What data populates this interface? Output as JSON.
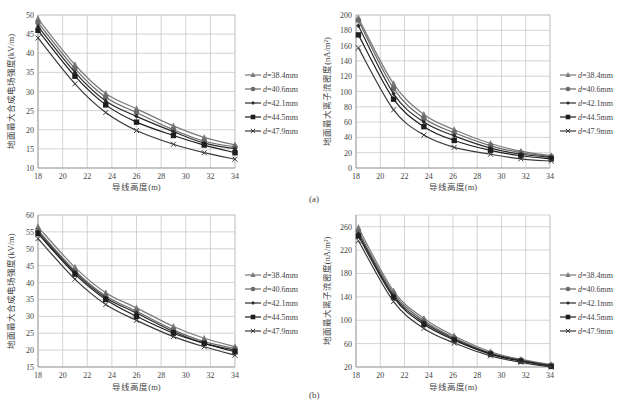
{
  "panels": {
    "a": "(a)",
    "b": "(b)"
  },
  "legend_labels": [
    "d=38.4mm",
    "d=40.6mm",
    "d=42.1mm",
    "d=44.5mm",
    "d=47.9mm"
  ],
  "chart_data": [
    {
      "id": "a-left",
      "type": "line",
      "title": "",
      "xlabel": "导线高度(m)",
      "ylabel": "地面最大合成电场强度(kV/m)",
      "xlim": [
        18,
        34
      ],
      "ylim": [
        10,
        50
      ],
      "xticks": [
        18,
        20,
        22,
        24,
        26,
        28,
        30,
        32,
        34
      ],
      "yticks": [
        10,
        15,
        20,
        25,
        30,
        35,
        40,
        45,
        50
      ],
      "grid": true,
      "legend_position": "right",
      "x": [
        18,
        21,
        23.5,
        26,
        29,
        31.5,
        34
      ],
      "series": [
        {
          "name": "d=38.4mm",
          "marker": "triangle",
          "values": [
            49.0,
            37.0,
            29.5,
            25.5,
            21.0,
            18.0,
            16.0
          ]
        },
        {
          "name": "d=40.6mm",
          "marker": "circle",
          "values": [
            48.0,
            36.0,
            28.5,
            24.5,
            20.0,
            17.0,
            15.5
          ]
        },
        {
          "name": "d=42.1mm",
          "marker": "diamond",
          "values": [
            47.0,
            35.0,
            27.5,
            23.5,
            19.5,
            16.5,
            15.0
          ]
        },
        {
          "name": "d=44.5mm",
          "marker": "square",
          "values": [
            46.0,
            34.0,
            26.5,
            22.0,
            18.5,
            16.0,
            14.0
          ]
        },
        {
          "name": "d=47.9mm",
          "marker": "x",
          "values": [
            44.0,
            32.0,
            24.5,
            19.8,
            16.2,
            14.0,
            12.3
          ]
        }
      ]
    },
    {
      "id": "a-right",
      "type": "line",
      "title": "",
      "xlabel": "导线高度(m)",
      "ylabel": "地面最大离子流密度(nA/m²)",
      "xlim": [
        18,
        34
      ],
      "ylim": [
        0,
        200
      ],
      "xticks": [
        18,
        20,
        22,
        24,
        26,
        28,
        30,
        32,
        34
      ],
      "yticks": [
        0,
        20,
        40,
        60,
        80,
        100,
        120,
        140,
        160,
        180,
        200
      ],
      "grid": true,
      "legend_position": "right",
      "x": [
        18.2,
        21.1,
        23.6,
        26.1,
        29.1,
        31.6,
        34.1
      ],
      "series": [
        {
          "name": "d=38.4mm",
          "marker": "triangle",
          "values": [
            196,
            110,
            70,
            50,
            32,
            22,
            16
          ]
        },
        {
          "name": "d=40.6mm",
          "marker": "circle",
          "values": [
            193,
            104,
            65,
            46,
            29,
            20,
            15
          ]
        },
        {
          "name": "d=42.1mm",
          "marker": "diamond",
          "values": [
            186,
            97,
            60,
            42,
            26,
            18,
            14
          ]
        },
        {
          "name": "d=44.5mm",
          "marker": "square",
          "values": [
            174,
            90,
            54,
            36,
            23,
            16,
            12
          ]
        },
        {
          "name": "d=47.9mm",
          "marker": "x",
          "values": [
            157,
            76,
            43,
            27,
            18,
            12,
            9
          ]
        }
      ]
    },
    {
      "id": "b-left",
      "type": "line",
      "title": "",
      "xlabel": "导线高度(m)",
      "ylabel": "地面最大合成电场强度(kV/m)",
      "xlim": [
        18,
        34
      ],
      "ylim": [
        15,
        60
      ],
      "xticks": [
        18,
        20,
        22,
        24,
        26,
        28,
        30,
        32,
        34
      ],
      "yticks": [
        15,
        20,
        25,
        30,
        35,
        40,
        45,
        50,
        55,
        60
      ],
      "grid": true,
      "legend_position": "right",
      "x": [
        18,
        21,
        23.5,
        26,
        29,
        31.5,
        34
      ],
      "series": [
        {
          "name": "d=38.4mm",
          "marker": "triangle",
          "values": [
            56.5,
            44.5,
            37.0,
            32.5,
            27.0,
            23.5,
            21.0
          ]
        },
        {
          "name": "d=40.6mm",
          "marker": "circle",
          "values": [
            55.5,
            43.5,
            36.0,
            31.5,
            26.0,
            22.5,
            20.5
          ]
        },
        {
          "name": "d=42.1mm",
          "marker": "diamond",
          "values": [
            55.0,
            43.0,
            35.5,
            31.0,
            25.5,
            22.0,
            20.0
          ]
        },
        {
          "name": "d=44.5mm",
          "marker": "square",
          "values": [
            54.5,
            42.5,
            35.0,
            30.0,
            25.0,
            22.0,
            19.5
          ]
        },
        {
          "name": "d=47.9mm",
          "marker": "x",
          "values": [
            53.0,
            41.0,
            33.5,
            28.8,
            24.0,
            21.0,
            18.5
          ]
        }
      ]
    },
    {
      "id": "b-right",
      "type": "line",
      "title": "",
      "xlabel": "导线高度(m)",
      "ylabel": "地面最大离子流密度(nA/m²)",
      "xlim": [
        18,
        34
      ],
      "ylim": [
        20,
        280
      ],
      "xticks": [
        18,
        20,
        22,
        24,
        26,
        28,
        30,
        32,
        34
      ],
      "yticks": [
        20,
        60,
        100,
        140,
        180,
        220,
        260
      ],
      "grid": true,
      "legend_position": "right",
      "x": [
        18.2,
        21.1,
        23.6,
        26.1,
        29.1,
        31.6,
        34.1
      ],
      "series": [
        {
          "name": "d=38.4mm",
          "marker": "triangle",
          "values": [
            258,
            150,
            103,
            73,
            46,
            33,
            24
          ]
        },
        {
          "name": "d=40.6mm",
          "marker": "circle",
          "values": [
            252,
            146,
            99,
            70,
            44,
            32,
            23
          ]
        },
        {
          "name": "d=42.1mm",
          "marker": "diamond",
          "values": [
            248,
            142,
            96,
            68,
            43,
            31,
            22
          ]
        },
        {
          "name": "d=44.5mm",
          "marker": "square",
          "values": [
            244,
            139,
            93,
            66,
            42,
            30,
            21
          ]
        },
        {
          "name": "d=47.9mm",
          "marker": "x",
          "values": [
            236,
            132,
            86,
            61,
            39,
            28,
            20
          ]
        }
      ]
    }
  ],
  "layout": [
    {
      "plot": [
        38,
        15,
        235,
        168
      ],
      "legend": [
        245,
        75
      ],
      "ylabel_x": 14,
      "xlabel_y": 190
    },
    {
      "plot": [
        356,
        15,
        550,
        168
      ],
      "legend": [
        560,
        75
      ],
      "ylabel_x": 330,
      "xlabel_y": 190
    },
    {
      "plot": [
        38,
        215,
        235,
        367
      ],
      "legend": [
        245,
        275
      ],
      "ylabel_x": 14,
      "xlabel_y": 390
    },
    {
      "plot": [
        356,
        215,
        550,
        367
      ],
      "legend": [
        560,
        275
      ],
      "ylabel_x": 330,
      "xlabel_y": 390
    }
  ],
  "colors": {
    "grid": "#c8c8c8",
    "axis": "#999999",
    "series": [
      "#7a7a7a",
      "#6a6a6a",
      "#2a2a2a",
      "#1e1e1e",
      "#3a3a3a"
    ]
  }
}
